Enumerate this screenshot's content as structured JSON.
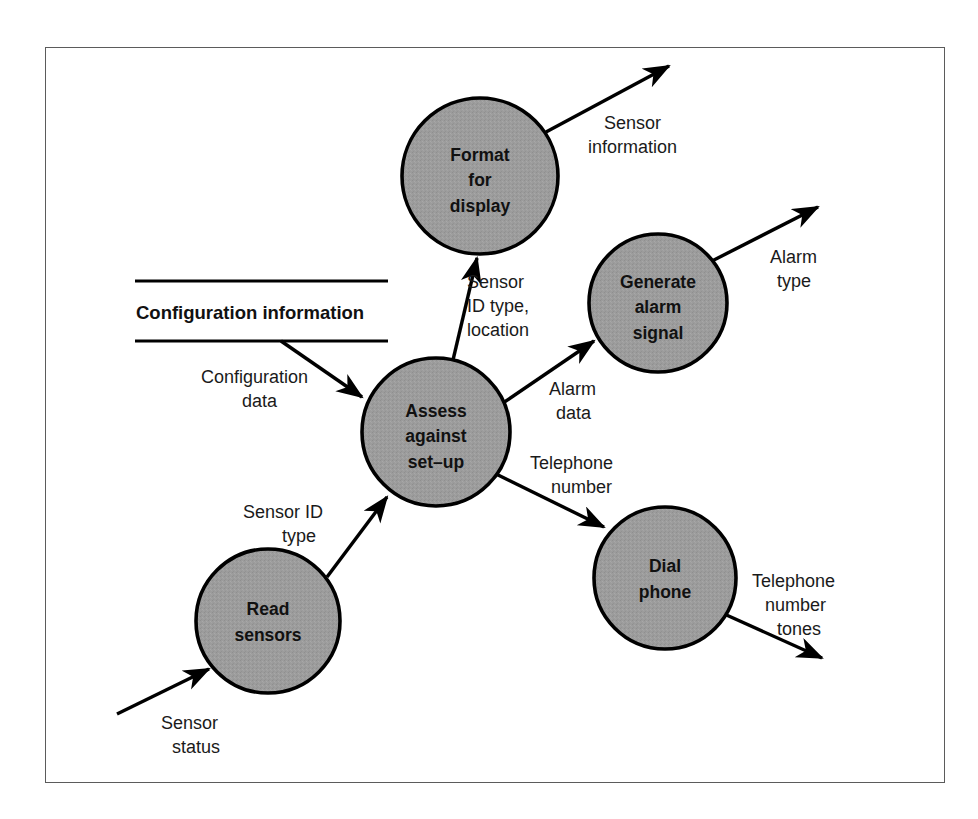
{
  "diagram": {
    "type": "data-flow-diagram",
    "title": "",
    "frame": {
      "border_color": "#5b5b5b",
      "background": "#ffffff"
    },
    "style": {
      "process_fill": "#9c9c9c",
      "process_stroke": "#000000",
      "flow_color": "#000000",
      "text_color": "#111111"
    },
    "processes": [
      {
        "id": "format-for-display",
        "name": "Format for display",
        "lines": [
          "Format",
          "for",
          "display"
        ],
        "cx": 480,
        "cy": 176,
        "r": 78
      },
      {
        "id": "generate-alarm-signal",
        "name": "Generate alarm signal",
        "lines": [
          "Generate",
          "alarm",
          "signal"
        ],
        "cx": 658,
        "cy": 303,
        "r": 69
      },
      {
        "id": "assess-against-set-up",
        "name": "Assess against set–up",
        "lines": [
          "Assess",
          "against",
          "set–up"
        ],
        "cx": 436,
        "cy": 432,
        "r": 74
      },
      {
        "id": "read-sensors",
        "name": "Read sensors",
        "lines": [
          "Read",
          "sensors"
        ],
        "cx": 268,
        "cy": 621,
        "r": 72
      },
      {
        "id": "dial-phone",
        "name": "Dial phone",
        "lines": [
          "Dial",
          "phone"
        ],
        "cx": 665,
        "cy": 578,
        "r": 71
      }
    ],
    "data_stores": [
      {
        "id": "configuration-information",
        "label": "Configuration information",
        "x1": 135,
        "x2": 388,
        "y_top": 281,
        "y_bottom": 341,
        "label_x": 136,
        "label_y": 318
      }
    ],
    "flows": [
      {
        "id": "sensor-information",
        "label_lines": [
          "Sensor",
          "information"
        ],
        "label_x": 604,
        "label_y": 129,
        "label_anchor": "start",
        "from": "format-for-display",
        "to": "external-sink",
        "path": "M 546 132 L 669 66",
        "arrow_at": "end"
      },
      {
        "id": "sensor-id-type-location",
        "label_lines": [
          "Sensor",
          "ID type,",
          "location"
        ],
        "label_x": 466,
        "label_y": 288,
        "label_anchor": "start",
        "from": "assess-against-set-up",
        "to": "format-for-display",
        "path": "M 453 360 L 477 256",
        "arrow_at": "end"
      },
      {
        "id": "alarm-type",
        "label_lines": [
          "Alarm",
          "type"
        ],
        "label_x": 770,
        "label_y": 262,
        "label_anchor": "start",
        "from": "generate-alarm-signal",
        "to": "external-sink",
        "path": "M 712 260 L 818 206",
        "arrow_at": "end"
      },
      {
        "id": "alarm-data",
        "label_lines": [
          "Alarm",
          "data"
        ],
        "label_x": 549,
        "label_y": 394,
        "label_anchor": "start",
        "from": "assess-against-set-up",
        "to": "generate-alarm-signal",
        "path": "M 503 403 L 597 339",
        "arrow_at": "end"
      },
      {
        "id": "configuration-data",
        "label_lines": [
          "Configuration",
          "data"
        ],
        "label_x": 200,
        "label_y": 383,
        "label_anchor": "start",
        "from": "configuration-information",
        "to": "assess-against-set-up",
        "path": "M 281 341 L 364 398",
        "arrow_at": "end"
      },
      {
        "id": "telephone-number",
        "label_lines": [
          "Telephone",
          "number"
        ],
        "label_x": 531,
        "label_y": 468,
        "label_anchor": "start",
        "from": "assess-against-set-up",
        "to": "dial-phone",
        "path": "M 492 472 L 607 528",
        "arrow_at": "end"
      },
      {
        "id": "sensor-id-type",
        "label_lines": [
          "Sensor ID",
          "type"
        ],
        "label_x": 244,
        "label_y": 518,
        "label_anchor": "start",
        "from": "read-sensors",
        "to": "assess-against-set-up",
        "path": "M 327 577 L 389 495",
        "arrow_at": "end"
      },
      {
        "id": "telephone-number-tones",
        "label_lines": [
          "Telephone",
          "number",
          "tones"
        ],
        "label_x": 755,
        "label_y": 586,
        "label_anchor": "start",
        "from": "dial-phone",
        "to": "external-sink",
        "path": "M 724 614 L 824 659",
        "arrow_at": "end"
      },
      {
        "id": "sensor-status",
        "label_lines": [
          "Sensor",
          "status"
        ],
        "label_x": 160,
        "label_y": 728,
        "label_anchor": "start",
        "from": "external-source",
        "to": "read-sensors",
        "path": "M 117 714 L 211 668",
        "arrow_at": "end"
      }
    ]
  }
}
